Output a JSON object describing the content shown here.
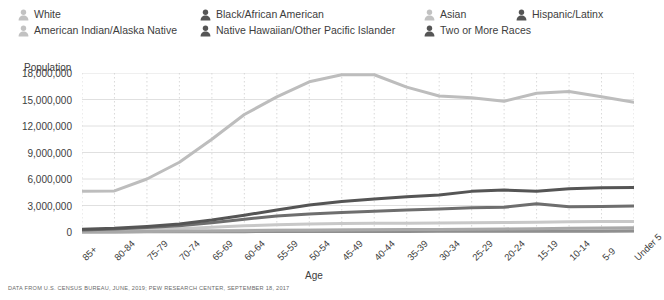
{
  "legend": {
    "items": [
      {
        "label": "White",
        "color": "#c2c2c2",
        "col": 0,
        "row": 0
      },
      {
        "label": "American Indian/Alaska Native",
        "color": "#c2c2c2",
        "col": 0,
        "row": 1
      },
      {
        "label": "Black/African American",
        "color": "#555555",
        "col": 1,
        "row": 0
      },
      {
        "label": "Native Hawaiian/Other Pacific Islander",
        "color": "#555555",
        "col": 1,
        "row": 1
      },
      {
        "label": "Asian",
        "color": "#c2c2c2",
        "col": 2,
        "row": 0
      },
      {
        "label": "Two or More Races",
        "color": "#555555",
        "col": 2,
        "row": 1
      },
      {
        "label": "Hispanic/Latinx",
        "color": "#555555",
        "col": 3,
        "row": 0
      }
    ]
  },
  "axis": {
    "y_title": "Population",
    "x_title": "Age",
    "y_ticks": [
      "18,000,000",
      "15,000,000",
      "12,000,000",
      "9,000,000",
      "6,000,000",
      "3,000,000",
      "0"
    ]
  },
  "source": "DATA FROM U.S. CENSUS BUREAU, JUNE, 2019; PEW RESEARCH CENTER, SEPTEMBER 18, 2017",
  "chart_data": {
    "type": "line",
    "title": "",
    "xlabel": "Age",
    "ylabel": "Population",
    "ylim": [
      0,
      18000000
    ],
    "ytick_step": 3000000,
    "grid": true,
    "legend_position": "top",
    "categories": [
      "85+",
      "80-84",
      "75-79",
      "70-74",
      "65-69",
      "60-64",
      "55-59",
      "50-54",
      "45-49",
      "40-44",
      "35-39",
      "30-34",
      "25-29",
      "20-24",
      "15-19",
      "10-14",
      "5-9",
      "Under 5"
    ],
    "series": [
      {
        "name": "White",
        "color": "#bdbdbd",
        "values": [
          4600000,
          4650000,
          6000000,
          7900000,
          10500000,
          13300000,
          15300000,
          17000000,
          17800000,
          17800000,
          16400000,
          15400000,
          15200000,
          14800000,
          15700000,
          15900000,
          15300000,
          14700000
        ]
      },
      {
        "name": "Black/African American",
        "color": "#555555",
        "values": [
          320000,
          420000,
          620000,
          900000,
          1350000,
          1900000,
          2500000,
          3050000,
          3450000,
          3750000,
          4000000,
          4200000,
          4600000,
          4750000,
          4600000,
          4900000,
          5000000,
          5050000
        ]
      },
      {
        "name": "Hispanic/Latinx",
        "color": "#6e6e6e",
        "values": [
          240000,
          330000,
          500000,
          720000,
          1050000,
          1450000,
          1800000,
          2050000,
          2200000,
          2350000,
          2500000,
          2600000,
          2750000,
          2800000,
          3200000,
          2850000,
          2900000,
          2950000
        ]
      },
      {
        "name": "Asian",
        "color": "#c8c8c8",
        "values": [
          120000,
          170000,
          260000,
          380000,
          540000,
          700000,
          820000,
          900000,
          950000,
          980000,
          1000000,
          1020000,
          1050000,
          1080000,
          1100000,
          1150000,
          1180000,
          1200000
        ]
      },
      {
        "name": "American Indian/Alaska Native",
        "color": "#d4d4d4",
        "values": [
          40000,
          55000,
          80000,
          110000,
          150000,
          185000,
          210000,
          230000,
          245000,
          255000,
          265000,
          275000,
          285000,
          295000,
          300000,
          310000,
          315000,
          320000
        ]
      },
      {
        "name": "Two or More Races",
        "color": "#a8a8a8",
        "values": [
          30000,
          40000,
          60000,
          85000,
          120000,
          155000,
          185000,
          210000,
          230000,
          250000,
          270000,
          290000,
          320000,
          350000,
          380000,
          420000,
          450000,
          480000
        ]
      },
      {
        "name": "Native Hawaiian/Other Pacific Islander",
        "color": "#8f8f8f",
        "values": [
          8000,
          11000,
          16000,
          23000,
          32000,
          42000,
          50000,
          57000,
          62000,
          66000,
          70000,
          74000,
          79000,
          84000,
          88000,
          93000,
          97000,
          100000
        ]
      }
    ]
  }
}
